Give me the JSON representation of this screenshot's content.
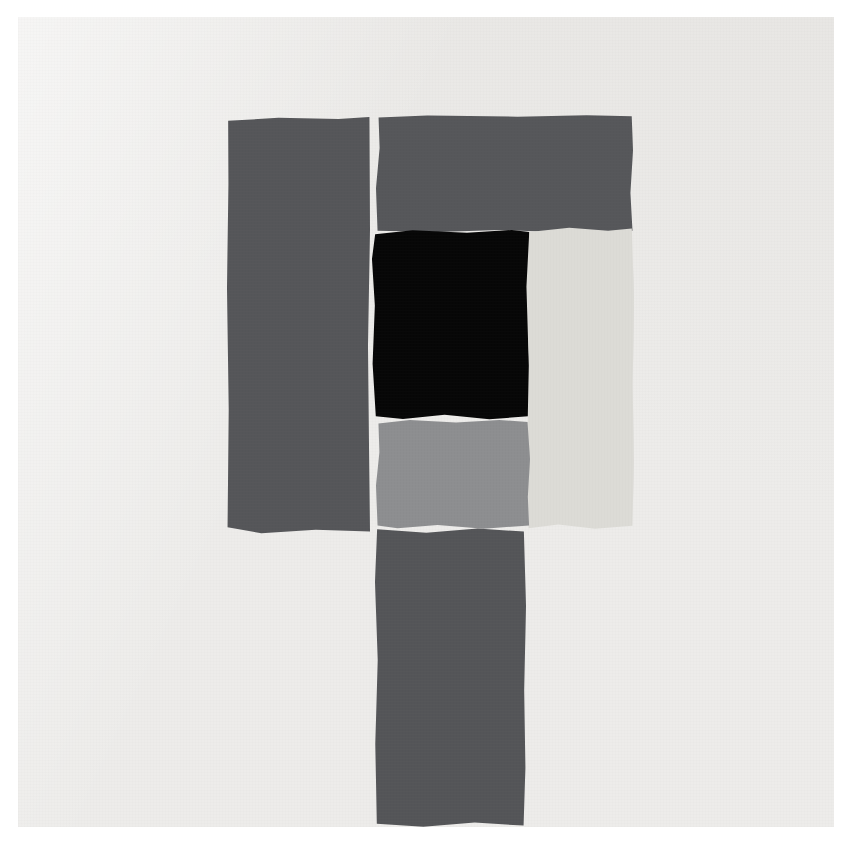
{
  "artwork": {
    "title": "Untitled (Torn Paper Collage)",
    "medium": "Cut and torn paper collage on board",
    "orientation": "square",
    "canvas": {
      "width": 852,
      "height": 846
    },
    "margin": {
      "label": "white border",
      "color": "#ffffff",
      "width_px": 18
    },
    "ground": {
      "name": "paper-ground",
      "label": "Off-white paper board",
      "color": "#edecea"
    },
    "palette": {
      "white_margin": "#ffffff",
      "ground_offwhite": "#edecea",
      "dark_gray": "#555659",
      "black": "#070707",
      "light_gray": "#dcdbd6",
      "medium_gray": "#8d8e90"
    },
    "shapes": [
      {
        "id": "left-strip",
        "label": "Left vertical dark gray strip",
        "color": "#555659",
        "color_name": "dark gray",
        "x": 227,
        "y": 117,
        "width": 143,
        "height": 417
      },
      {
        "id": "top-bar",
        "label": "Upper horizontal dark gray rectangle",
        "color": "#56575a",
        "color_name": "dark gray",
        "x": 376,
        "y": 115,
        "width": 257,
        "height": 118
      },
      {
        "id": "black-square",
        "label": "Central black square",
        "color": "#070707",
        "color_name": "black",
        "x": 371,
        "y": 228,
        "width": 160,
        "height": 194
      },
      {
        "id": "right-light",
        "label": "Right vertical light gray rectangle",
        "color": "#dcdbd6",
        "color_name": "light gray",
        "x": 526,
        "y": 226,
        "width": 108,
        "height": 304
      },
      {
        "id": "mid-gray",
        "label": "Medium gray rectangle below black square",
        "color": "#8d8e90",
        "color_name": "medium gray",
        "x": 376,
        "y": 419,
        "width": 154,
        "height": 111
      },
      {
        "id": "bottom-strip",
        "label": "Lower vertical dark gray strip",
        "color": "#545558",
        "color_name": "dark gray",
        "x": 375,
        "y": 528,
        "width": 151,
        "height": 300
      }
    ]
  }
}
